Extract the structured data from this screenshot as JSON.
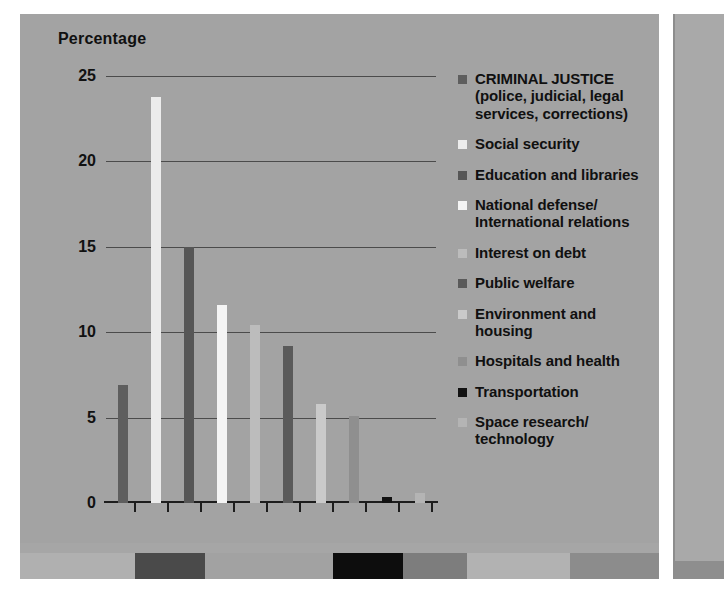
{
  "chart_data": {
    "type": "bar",
    "title": "Percentage",
    "xlabel": "",
    "ylabel": "Percentage",
    "ylim": [
      0,
      25
    ],
    "yticks": [
      0,
      5,
      10,
      15,
      20,
      25
    ],
    "ytick_labels": [
      "0",
      "5",
      "10",
      "15",
      "20",
      "25"
    ],
    "grid": true,
    "legend_position": "right",
    "categories": [
      "CRIMINAL JUSTICE (police, judicial, legal services, corrections)",
      "Social security",
      "Education and libraries",
      "National defense/International relations",
      "Interest on debt",
      "Public welfare",
      "Environment and housing",
      "Hospitals and health",
      "Transportation",
      "Space research/technology"
    ],
    "values": [
      6.9,
      23.8,
      15.0,
      11.6,
      10.4,
      9.2,
      5.8,
      5.1,
      0.35,
      0.6
    ],
    "colors": [
      "#5e5e5e",
      "#ececec",
      "#565656",
      "#f4f4f4",
      "#bcbcbc",
      "#5a5a5a",
      "#cacaca",
      "#8f8f8f",
      "#121212",
      "#b4b4b4"
    ]
  },
  "plot": {
    "axis_title": "Percentage"
  },
  "legend": {
    "items": [
      {
        "label": "CRIMINAL JUSTICE\n(police, judicial, legal\nservices, corrections)",
        "color": "#5e5e5e"
      },
      {
        "label": "Social security",
        "color": "#ececec"
      },
      {
        "label": "Education and libraries",
        "color": "#565656"
      },
      {
        "label": "National defense/\nInternational relations",
        "color": "#f4f4f4"
      },
      {
        "label": "Interest on debt",
        "color": "#bcbcbc"
      },
      {
        "label": "Public welfare",
        "color": "#5a5a5a"
      },
      {
        "label": "Environment and\nhousing",
        "color": "#cacaca"
      },
      {
        "label": "Hospitals and health",
        "color": "#8f8f8f"
      },
      {
        "label": "Transportation",
        "color": "#121212"
      },
      {
        "label": "Space research/\ntechnology",
        "color": "#b4b4b4"
      }
    ]
  },
  "footer_strip": {
    "segments": [
      {
        "color": "#b0b0b0",
        "width": 18
      },
      {
        "color": "#4a4a4a",
        "width": 11
      },
      {
        "color": "#a2a2a2",
        "width": 20
      },
      {
        "color": "#0d0d0d",
        "width": 11
      },
      {
        "color": "#7d7d7d",
        "width": 10
      },
      {
        "color": "#b2b2b2",
        "width": 16
      },
      {
        "color": "#8c8c8c",
        "width": 14
      }
    ]
  },
  "colors": {
    "panel_background": "#a3a3a3",
    "gridline": "#4b4b4b",
    "axis": "#1d1d1d",
    "text": "#101010"
  }
}
